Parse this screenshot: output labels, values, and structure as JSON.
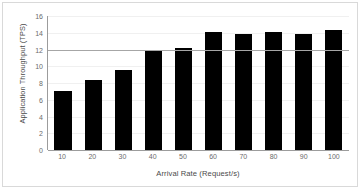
{
  "chart_data": {
    "type": "bar",
    "title": "",
    "xlabel": "Arrival Rate (Request/s)",
    "ylabel": "Application Throughput (TPS)",
    "categories": [
      "10",
      "20",
      "30",
      "40",
      "50",
      "60",
      "70",
      "80",
      "90",
      "100"
    ],
    "values": [
      7.0,
      8.4,
      9.6,
      11.8,
      12.2,
      14.1,
      13.8,
      14.1,
      13.8,
      14.3
    ],
    "series": [
      {
        "name": "Application Throughput",
        "values": [
          7.0,
          8.4,
          9.6,
          11.8,
          12.2,
          14.1,
          13.8,
          14.1,
          13.8,
          14.3
        ],
        "color": "#000000"
      }
    ],
    "ylim": [
      0,
      16
    ],
    "yticks": [
      0,
      2,
      4,
      6,
      8,
      10,
      12,
      14,
      16
    ],
    "ytick_labels": [
      "0",
      "2",
      "4",
      "6",
      "8",
      "10",
      "12",
      "14",
      "16"
    ],
    "grid": true,
    "legend": false,
    "reference_line": {
      "name": "capacity-reference-line",
      "value": 12,
      "color": "#a6a6a6"
    },
    "colors": {
      "bar": "#000000",
      "gridline": "#f0f0f0",
      "axis": "#9c9c9c",
      "tick_text": "#6b6b6b",
      "title_text": "#4a4a4a",
      "frame_border": "#d9d9d9",
      "background": "#ffffff"
    }
  }
}
